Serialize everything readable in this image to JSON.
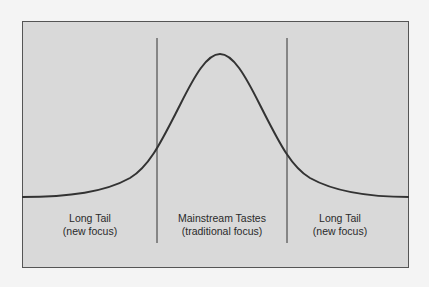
{
  "diagram": {
    "type": "long-tail-distribution",
    "colors": {
      "page_background": "#f4f4f4",
      "panel_fill": "#d9d9d9",
      "panel_border": "#555555",
      "curve": "#333333",
      "divider": "#333333",
      "text": "#2a2a2a"
    },
    "regions": [
      {
        "title": "Long Tail",
        "subtitle": "(new focus)"
      },
      {
        "title": "Mainstream Tastes",
        "subtitle": "(traditional focus)"
      },
      {
        "title": "Long Tail",
        "subtitle": "(new focus)"
      }
    ]
  }
}
